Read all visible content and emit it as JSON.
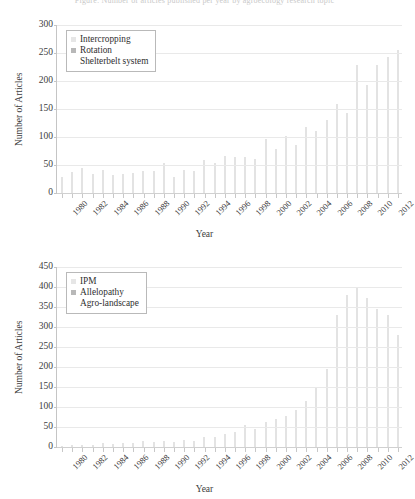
{
  "page": {
    "clipped_caption": "Figure: Number of articles published per year by agroecology research topic"
  },
  "charts": [
    {
      "id": "chart-top",
      "legend": {
        "items": [
          {
            "label": "Intercropping",
            "swatch": "sw0"
          },
          {
            "label": "Rotation",
            "swatch": "sw1"
          },
          {
            "label": "Shelterbelt system",
            "swatch": "sw2"
          }
        ]
      },
      "chart_data": {
        "type": "bar",
        "title": "",
        "xlabel": "Year",
        "ylabel": "Number of Articles",
        "ylim": [
          0,
          300
        ],
        "ytick_step": 50,
        "yticks": [
          0,
          50,
          100,
          150,
          200,
          250,
          300
        ],
        "grid": true,
        "legend_position": "top-left",
        "x": [
          1980,
          1981,
          1982,
          1983,
          1984,
          1985,
          1986,
          1987,
          1988,
          1989,
          1990,
          1991,
          1992,
          1993,
          1994,
          1995,
          1996,
          1997,
          1998,
          1999,
          2000,
          2001,
          2002,
          2003,
          2004,
          2005,
          2006,
          2007,
          2008,
          2009,
          2010,
          2011,
          2012,
          2013
        ],
        "xtick_labels": [
          "1980",
          "1982",
          "1984",
          "1986",
          "1988",
          "1990",
          "1992",
          "1994",
          "1996",
          "1998",
          "2000",
          "2002",
          "2004",
          "2006",
          "2008",
          "2010",
          "2012"
        ],
        "series": [
          {
            "name": "Intercropping",
            "values": [
              29,
              37,
              45,
              34,
              41,
              32,
              34,
              35,
              40,
              40,
              53,
              29,
              41,
              40,
              59,
              54,
              66,
              65,
              64,
              60,
              96,
              79,
              102,
              86,
              117,
              111,
              130,
              159,
              143,
              229,
              193,
              228,
              243,
              255
            ]
          }
        ]
      }
    },
    {
      "id": "chart-bottom",
      "legend": {
        "items": [
          {
            "label": "IPM",
            "swatch": "sw0"
          },
          {
            "label": "Allelopathy",
            "swatch": "sw1"
          },
          {
            "label": "Agro-landscape",
            "swatch": "sw2"
          }
        ]
      },
      "chart_data": {
        "type": "bar",
        "title": "",
        "xlabel": "Year",
        "ylabel": "Number of Articles",
        "ylim": [
          0,
          450
        ],
        "ytick_step": 50,
        "yticks": [
          0,
          50,
          100,
          150,
          200,
          250,
          300,
          350,
          400,
          450
        ],
        "grid": true,
        "legend_position": "top-left",
        "x": [
          1980,
          1981,
          1982,
          1983,
          1984,
          1985,
          1986,
          1987,
          1988,
          1989,
          1990,
          1991,
          1992,
          1993,
          1994,
          1995,
          1996,
          1997,
          1998,
          1999,
          2000,
          2001,
          2002,
          2003,
          2004,
          2005,
          2006,
          2007,
          2008,
          2009,
          2010,
          2011,
          2012,
          2013
        ],
        "xtick_labels": [
          "1980",
          "1982",
          "1984",
          "1986",
          "1988",
          "1990",
          "1992",
          "1994",
          "1996",
          "1998",
          "2000",
          "2002",
          "2004",
          "2006",
          "2008",
          "2010",
          "2012"
        ],
        "series": [
          {
            "name": "IPM",
            "values": [
              3,
              4,
              6,
              5,
              9,
              8,
              11,
              9,
              14,
              13,
              15,
              12,
              17,
              16,
              26,
              24,
              33,
              37,
              55,
              45,
              62,
              70,
              78,
              92,
              115,
              148,
              196,
              330,
              380,
              400,
              372,
              345,
              330,
              280
            ]
          }
        ]
      }
    }
  ]
}
